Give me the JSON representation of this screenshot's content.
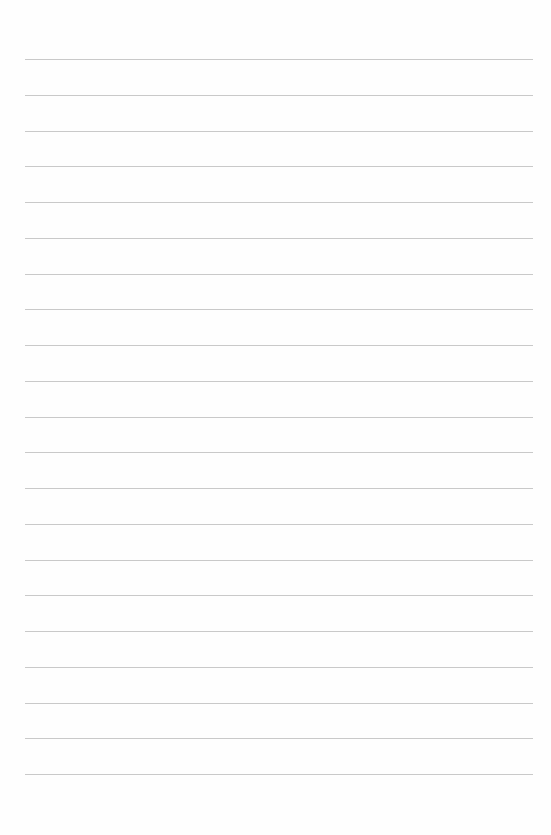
{
  "document": {
    "type": "lined-paper",
    "line_count": 21,
    "first_line_y": 59,
    "line_spacing": 35.75,
    "line_left": 25,
    "line_right": 533,
    "line_color": "#c9c9c9",
    "background_color": "#fefefe"
  }
}
